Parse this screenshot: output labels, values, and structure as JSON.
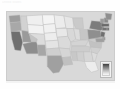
{
  "page": {
    "background_color": "#fefefe",
    "header_note": "United States"
  },
  "map": {
    "title": "United States choropleth map",
    "frame_color": "#cccccc",
    "ocean_color": "#d9d9d9",
    "border_color": "#b9b9b9",
    "legend": {
      "name": "legend",
      "orientation": "vertical",
      "gradient_high_color": "#3f3f3f",
      "gradient_low_color": "#f7f7f7",
      "background_color": "#f2f2f2"
    }
  },
  "chart_data": {
    "type": "map",
    "subtitle": "",
    "xlabel": "",
    "ylabel": "",
    "legend_position": "bottom-right",
    "colorscale": [
      "#f7f7f7",
      "#dedede",
      "#b4b4b4",
      "#7a7a7a",
      "#3f3f3f"
    ],
    "regions": [
      {
        "code": "WA",
        "name": "Washington",
        "fill": "#9d9d9d",
        "level": 3
      },
      {
        "code": "OR",
        "name": "Oregon",
        "fill": "#a8a8a8",
        "level": 3
      },
      {
        "code": "CA",
        "name": "California",
        "fill": "#6f6f6f",
        "level": 4
      },
      {
        "code": "ID",
        "name": "Idaho",
        "fill": "#d2d2d2",
        "level": 2
      },
      {
        "code": "NV",
        "name": "Nevada",
        "fill": "#9a9a9a",
        "level": 3
      },
      {
        "code": "UT",
        "name": "Utah",
        "fill": "#c4c4c4",
        "level": 2
      },
      {
        "code": "AZ",
        "name": "Arizona",
        "fill": "#8d8d8d",
        "level": 3
      },
      {
        "code": "MT",
        "name": "Montana",
        "fill": "#efefef",
        "level": 1
      },
      {
        "code": "WY",
        "name": "Wyoming",
        "fill": "#f2f2f2",
        "level": 1
      },
      {
        "code": "CO",
        "name": "Colorado",
        "fill": "#dcdcdc",
        "level": 2
      },
      {
        "code": "NM",
        "name": "New Mexico",
        "fill": "#a6a6a6",
        "level": 3
      },
      {
        "code": "ND",
        "name": "North Dakota",
        "fill": "#f4f4f4",
        "level": 1
      },
      {
        "code": "SD",
        "name": "South Dakota",
        "fill": "#f1f1f1",
        "level": 1
      },
      {
        "code": "NE",
        "name": "Nebraska",
        "fill": "#ededed",
        "level": 1
      },
      {
        "code": "KS",
        "name": "Kansas",
        "fill": "#e4e4e4",
        "level": 1
      },
      {
        "code": "OK",
        "name": "Oklahoma",
        "fill": "#cfcfcf",
        "level": 2
      },
      {
        "code": "TX",
        "name": "Texas",
        "fill": "#a0a0a0",
        "level": 3
      },
      {
        "code": "MN",
        "name": "Minnesota",
        "fill": "#ececec",
        "level": 1
      },
      {
        "code": "IA",
        "name": "Iowa",
        "fill": "#e8e8e8",
        "level": 1
      },
      {
        "code": "MO",
        "name": "Missouri",
        "fill": "#dadada",
        "level": 2
      },
      {
        "code": "AR",
        "name": "Arkansas",
        "fill": "#d5d5d5",
        "level": 2
      },
      {
        "code": "LA",
        "name": "Louisiana",
        "fill": "#c0c0c0",
        "level": 2
      },
      {
        "code": "WI",
        "name": "Wisconsin",
        "fill": "#e6e6e6",
        "level": 1
      },
      {
        "code": "IL",
        "name": "Illinois",
        "fill": "#d8d8d8",
        "level": 2
      },
      {
        "code": "MI",
        "name": "Michigan",
        "fill": "#cacaca",
        "level": 2
      },
      {
        "code": "IN",
        "name": "Indiana",
        "fill": "#dcdcdc",
        "level": 2
      },
      {
        "code": "OH",
        "name": "Ohio",
        "fill": "#c6c6c6",
        "level": 2
      },
      {
        "code": "KY",
        "name": "Kentucky",
        "fill": "#d4d4d4",
        "level": 2
      },
      {
        "code": "TN",
        "name": "Tennessee",
        "fill": "#cdcdcd",
        "level": 2
      },
      {
        "code": "MS",
        "name": "Mississippi",
        "fill": "#c8c8c8",
        "level": 2
      },
      {
        "code": "AL",
        "name": "Alabama",
        "fill": "#cfcfcf",
        "level": 2
      },
      {
        "code": "GA",
        "name": "Georgia",
        "fill": "#d6d6d6",
        "level": 2
      },
      {
        "code": "FL",
        "name": "Florida",
        "fill": "#ededed",
        "level": 1
      },
      {
        "code": "SC",
        "name": "South Carolina",
        "fill": "#dcdcdc",
        "level": 2
      },
      {
        "code": "NC",
        "name": "North Carolina",
        "fill": "#d0d0d0",
        "level": 2
      },
      {
        "code": "VA",
        "name": "Virginia",
        "fill": "#c2c2c2",
        "level": 2
      },
      {
        "code": "WV",
        "name": "West Virginia",
        "fill": "#cbcbcb",
        "level": 2
      },
      {
        "code": "PA",
        "name": "Pennsylvania",
        "fill": "#8f8f8f",
        "level": 3
      },
      {
        "code": "NY",
        "name": "New York",
        "fill": "#7c7c7c",
        "level": 4
      },
      {
        "code": "VT",
        "name": "Vermont",
        "fill": "#9b9b9b",
        "level": 3
      },
      {
        "code": "NH",
        "name": "New Hampshire",
        "fill": "#8a8a8a",
        "level": 3
      },
      {
        "code": "ME",
        "name": "Maine",
        "fill": "#8f8f8f",
        "level": 3
      },
      {
        "code": "MA",
        "name": "Massachusetts",
        "fill": "#6a6a6a",
        "level": 4
      },
      {
        "code": "CT",
        "name": "Connecticut",
        "fill": "#747474",
        "level": 4
      },
      {
        "code": "RI",
        "name": "Rhode Island",
        "fill": "#6e6e6e",
        "level": 4
      },
      {
        "code": "NJ",
        "name": "New Jersey",
        "fill": "#707070",
        "level": 4
      },
      {
        "code": "DE",
        "name": "Delaware",
        "fill": "#8b8b8b",
        "level": 3
      },
      {
        "code": "MD",
        "name": "Maryland",
        "fill": "#9f9f9f",
        "level": 3
      }
    ]
  }
}
